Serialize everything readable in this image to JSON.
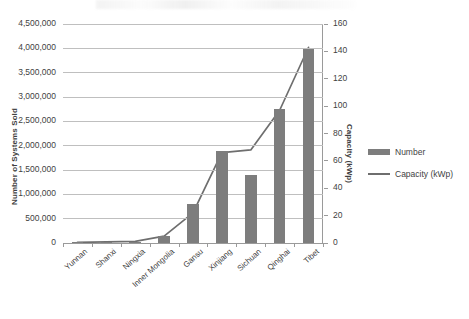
{
  "chart_data": {
    "type": "bar",
    "title": "",
    "subtitle": "",
    "xlabel": "",
    "ylabel": "Number of Systems Sold",
    "y2label": "Capacity (kWp)",
    "categories": [
      "Yunnan",
      "Shanxi",
      "Ningxia",
      "Inner Mongolia",
      "Gansu",
      "Xinjiang",
      "Sichuan",
      "Qinghai",
      "Tibet"
    ],
    "series": [
      {
        "name": "Number",
        "type": "bar",
        "axis": "left",
        "color": "#7d7d7d",
        "values": [
          8000,
          10000,
          12000,
          150000,
          800000,
          1900000,
          1400000,
          2750000,
          3980000
        ]
      },
      {
        "name": "Capacity (kWp)",
        "type": "line",
        "axis": "right",
        "color": "#6e6e6e",
        "values": [
          0.5,
          0.8,
          1.2,
          5,
          22,
          66,
          68,
          97,
          143
        ]
      }
    ],
    "ylim": [
      0,
      4500000
    ],
    "y2lim": [
      0,
      160
    ],
    "yticks": [
      "0",
      "500,000",
      "1,000,000",
      "1,500,000",
      "2,000,000",
      "2,500,000",
      "3,000,000",
      "3,500,000",
      "4,000,000",
      "4,500,000"
    ],
    "y2ticks": [
      "0",
      "20",
      "40",
      "60",
      "80",
      "100",
      "120",
      "140",
      "160"
    ],
    "grid": true,
    "legend_position": "right",
    "legend": [
      {
        "label": "Number",
        "marker": "bar-swatch",
        "color": "#7d7d7d"
      },
      {
        "label": "Capacity (kWp)",
        "marker": "line-swatch",
        "color": "#6e6e6e"
      }
    ]
  }
}
